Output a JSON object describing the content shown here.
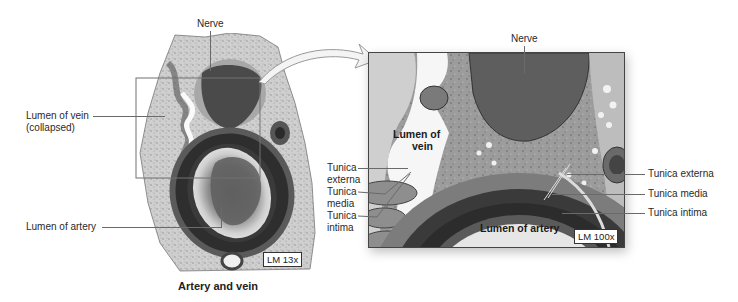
{
  "figure": {
    "left_panel": {
      "caption": "Artery and vein",
      "magnification": "LM 13x",
      "labels": {
        "nerve": "Nerve",
        "lumen_vein_line1": "Lumen of vein",
        "lumen_vein_line2": "(collapsed)",
        "lumen_artery": "Lumen of artery"
      }
    },
    "right_panel": {
      "magnification": "LM 100x",
      "labels": {
        "nerve": "Nerve",
        "lumen_vein_line1": "Lumen of",
        "lumen_vein_line2": "vein",
        "lumen_artery": "Lumen of artery",
        "vein_tunica_externa_line1": "Tunica",
        "vein_tunica_externa_line2": "externa",
        "vein_tunica_media_line1": "Tunica",
        "vein_tunica_media_line2": "media",
        "vein_tunica_intima_line1": "Tunica",
        "vein_tunica_intima_line2": "intima",
        "artery_tunica_externa": "Tunica externa",
        "artery_tunica_media": "Tunica media",
        "artery_tunica_intima": "Tunica intima"
      }
    },
    "colors": {
      "tissue_light": "#d8d8d8",
      "tissue_mid": "#8a8a8a",
      "tissue_dark": "#3a3a3a",
      "leader_line": "#6a6a6a"
    }
  }
}
